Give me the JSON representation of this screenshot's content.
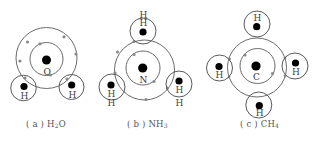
{
  "figure": {
    "panels": [
      {
        "id": "a",
        "molecule": "H2O",
        "caption_prefix": "( a ) ",
        "caption_formula_main": "H",
        "caption_formula_sub": "2",
        "caption_formula_tail": "O",
        "central_atom": "O",
        "hydrogen_label": "H",
        "hydrogen_count": 2
      },
      {
        "id": "b",
        "molecule": "NH3",
        "caption_prefix": "( b ) ",
        "caption_formula_main": "NH",
        "caption_formula_sub": "3",
        "caption_formula_tail": "",
        "central_atom": "N",
        "hydrogen_label": "H",
        "hydrogen_count": 3
      },
      {
        "id": "c",
        "molecule": "CH4",
        "caption_prefix": "( c ) ",
        "caption_formula_main": "CH",
        "caption_formula_sub": "4",
        "caption_formula_tail": "",
        "central_atom": "C",
        "hydrogen_label": "H",
        "hydrogen_count": 4
      }
    ],
    "colors": {
      "nucleus": "#000000",
      "shell_line": "#6b6b6b",
      "electron_dot": "#8a8a8a",
      "text": "#444444"
    }
  }
}
